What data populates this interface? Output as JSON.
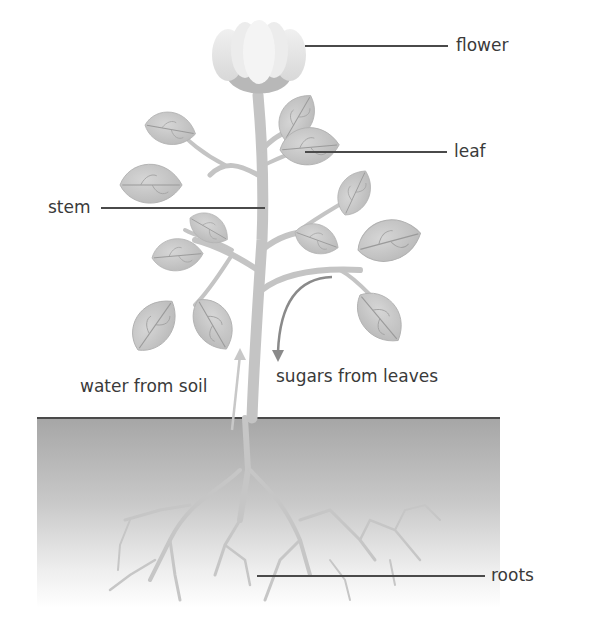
{
  "diagram": {
    "labels": {
      "flower": "flower",
      "leaf": "leaf",
      "stem": "stem",
      "water": "water from soil",
      "sugars": "sugars from leaves",
      "roots": "roots"
    },
    "colors": {
      "leaf_fill": "#c9c9c9",
      "leaf_vein": "#9a9a9a",
      "stem": "#c4c4c4",
      "flower_petal": "#e6e6e6",
      "soil_top": "#a8a8a8",
      "soil_bottom": "#ffffff",
      "ground_line": "#4a4a4a",
      "water_arrow": "#c8c8c8",
      "sugar_arrow": "#8a8a8a",
      "text": "#3a3a3a"
    }
  }
}
